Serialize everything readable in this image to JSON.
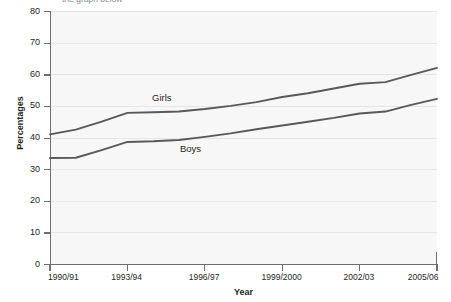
{
  "caption": {
    "clipped_top_text": "the graph below"
  },
  "axis": {
    "y_title": "Percentages",
    "x_title": "Year",
    "y_ticks": [
      0,
      10,
      20,
      30,
      40,
      50,
      60,
      70,
      80
    ],
    "x_ticks": [
      "1990/91",
      "1993/94",
      "1996/97",
      "1999/2000",
      "2002/03",
      "2005/06"
    ]
  },
  "series_labels": {
    "girls": "Girls",
    "boys": "Boys"
  },
  "colors": {
    "line": "#58595b",
    "axis": "#6d6e71",
    "plot_background": "#f7f7f7",
    "grid": "#e6e6e6",
    "text": "#231f20"
  },
  "chart_data": {
    "type": "line",
    "title": "",
    "xlabel": "Year",
    "ylabel": "Percentages",
    "ylim": [
      0,
      80
    ],
    "ytick_step": 10,
    "grid": true,
    "legend": "inline-labels",
    "x": [
      "1990/91",
      "1991/92",
      "1992/93",
      "1993/94",
      "1994/95",
      "1995/96",
      "1996/97",
      "1997/98",
      "1998/99",
      "1999/2000",
      "2000/01",
      "2001/02",
      "2002/03",
      "2003/04",
      "2004/05",
      "2005/06"
    ],
    "x_tick_labels": [
      "1990/91",
      "1993/94",
      "1996/97",
      "1999/2000",
      "2002/03",
      "2005/06"
    ],
    "series": [
      {
        "name": "Girls",
        "values": [
          41.0,
          42.5,
          45.0,
          47.8,
          48.0,
          48.2,
          49.0,
          50.0,
          51.2,
          52.8,
          54.0,
          55.5,
          57.0,
          57.5,
          59.8,
          62.0
        ]
      },
      {
        "name": "Boys",
        "values": [
          33.5,
          33.6,
          36.0,
          38.6,
          38.8,
          39.2,
          40.2,
          41.3,
          42.6,
          43.8,
          45.0,
          46.2,
          47.6,
          48.2,
          50.3,
          52.2
        ]
      }
    ]
  }
}
